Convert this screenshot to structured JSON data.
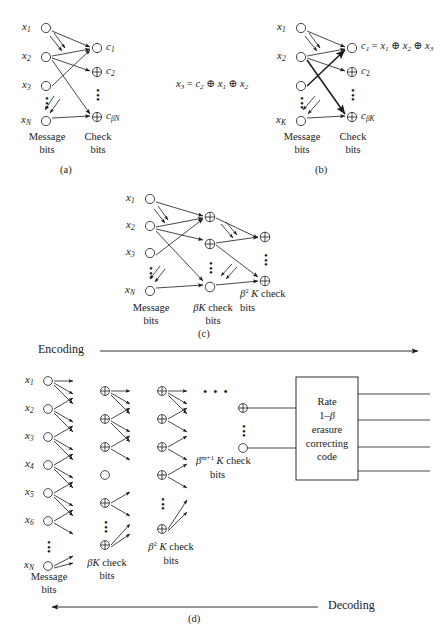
{
  "figure": {
    "type": "four-panel coding-theory block diagram",
    "panels": [
      {
        "id": "a",
        "label": "(a)"
      },
      {
        "id": "b",
        "label": "(b)"
      },
      {
        "id": "c",
        "label": "(c)"
      },
      {
        "id": "d",
        "label": "(d)"
      }
    ]
  },
  "common": {
    "message_bits": "Message\nbits",
    "message_bits_l1": "Message",
    "message_bits_l2": "bits",
    "check_bits_l1": "Check",
    "check_bits_l2": "bits",
    "xor_symbol": "⊕",
    "vdots": "⋮",
    "hdots": "• • •"
  },
  "panel_a": {
    "id": "(a)",
    "left_nodes": [
      "x1",
      "x2",
      "x3",
      "xN"
    ],
    "left_labels": [
      {
        "base": "x",
        "sub": "1"
      },
      {
        "base": "x",
        "sub": "2"
      },
      {
        "base": "x",
        "sub": "3"
      },
      {
        "base": "x",
        "sub": "N"
      }
    ],
    "right_labels": [
      {
        "base": "c",
        "sub": "1"
      },
      {
        "base": "c",
        "sub": "2"
      },
      {
        "base": "c",
        "sub": "βN"
      }
    ],
    "left_caption_l1": "Message",
    "left_caption_l2": "bits",
    "right_caption_l1": "Check",
    "right_caption_l2": "bits",
    "left_node_shape": "circle",
    "right_node_shapes": [
      "circle",
      "xor",
      "xor"
    ]
  },
  "panel_b": {
    "id": "(b)",
    "left_labels": [
      {
        "base": "x",
        "sub": "1"
      },
      {
        "base": "x",
        "sub": "2"
      },
      {
        "base": "",
        "sub": ""
      },
      {
        "base": "x",
        "sub": "K"
      }
    ],
    "right_labels": [
      {
        "base": "c",
        "sub": "1"
      },
      {
        "base": "c",
        "sub": "2"
      },
      {
        "base": "c",
        "sub": "βK"
      }
    ],
    "equation_right": "c1 = x1 ⊕ x2 ⊕ x3",
    "equation_left": "x3 = c2 ⊕ x1 ⊕ x2",
    "left_caption_l1": "Message",
    "left_caption_l2": "bits",
    "right_caption_l1": "Check",
    "right_caption_l2": "bits"
  },
  "panel_c": {
    "id": "(c)",
    "left_labels": [
      {
        "base": "x",
        "sub": "1"
      },
      {
        "base": "x",
        "sub": "2"
      },
      {
        "base": "x",
        "sub": "3"
      },
      {
        "base": "x",
        "sub": "N"
      }
    ],
    "col1_caption_l1": "Message",
    "col1_caption_l2": "bits",
    "col2_caption_l1": "βK check",
    "col2_caption_l2": "bits",
    "col3_caption_l1": "β² K check",
    "col3_caption_l2": "bits",
    "col3_beta": "β",
    "col3_exp": "2",
    "col3_rest": " K check"
  },
  "panel_d": {
    "id": "(d)",
    "encoding_label": "Encoding",
    "decoding_label": "Decoding",
    "left_labels": [
      {
        "base": "x",
        "sub": "1"
      },
      {
        "base": "x",
        "sub": "2"
      },
      {
        "base": "x",
        "sub": "3"
      },
      {
        "base": "x",
        "sub": "4"
      },
      {
        "base": "x",
        "sub": "5"
      },
      {
        "base": "x",
        "sub": "6"
      },
      {
        "base": "x",
        "sub": "N"
      }
    ],
    "col1_caption_l1": "Message",
    "col1_caption_l2": "bits",
    "col2_caption_l1": "βK check",
    "col2_caption_l2": "bits",
    "col3_caption_l1": "β² K check",
    "col3_caption_l2": "bits",
    "col4_caption_l1": "βᵐ⁺¹ K check",
    "col4_caption_l2": "bits",
    "col4_beta": "β",
    "col4_exp": "m+1",
    "col4_rest": " K check",
    "box": {
      "line1": "Rate",
      "line2": "1–β",
      "line3": "erasure",
      "line4": "correcting",
      "line5": "code",
      "inputs": 2,
      "outputs": 4
    }
  }
}
